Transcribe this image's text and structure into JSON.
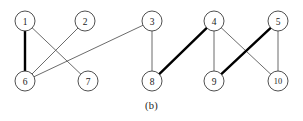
{
  "figure": {
    "caption": "(b)",
    "width": 303,
    "height": 121,
    "background_color": "#ffffff"
  },
  "chart_data": {
    "type": "diagram",
    "diagram_type": "graph-with-matching",
    "title": "",
    "caption": "(b)",
    "node_radius": 10,
    "node_count": 10,
    "edge_count": 10,
    "colors": {
      "thin_edge": "#5a5a5a",
      "thick_edge": "#000000",
      "node_stroke": "#3c3c3c",
      "node_fill": "#ffffff",
      "label": "#1a1a1a"
    },
    "nodes": [
      {
        "id": "1",
        "label": "1",
        "x": 25,
        "y": 21
      },
      {
        "id": "2",
        "label": "2",
        "x": 85,
        "y": 21
      },
      {
        "id": "3",
        "label": "3",
        "x": 152,
        "y": 21
      },
      {
        "id": "4",
        "label": "4",
        "x": 214,
        "y": 21
      },
      {
        "id": "5",
        "label": "5",
        "x": 278,
        "y": 21
      },
      {
        "id": "6",
        "label": "6",
        "x": 25,
        "y": 81
      },
      {
        "id": "7",
        "label": "7",
        "x": 88,
        "y": 81
      },
      {
        "id": "8",
        "label": "8",
        "x": 152,
        "y": 81
      },
      {
        "id": "9",
        "label": "9",
        "x": 214,
        "y": 81
      },
      {
        "id": "10",
        "label": "10",
        "x": 278,
        "y": 81
      }
    ],
    "edges": [
      {
        "source": "1",
        "target": "6",
        "weight": "thick"
      },
      {
        "source": "1",
        "target": "7",
        "weight": "thin"
      },
      {
        "source": "2",
        "target": "6",
        "weight": "thin"
      },
      {
        "source": "6",
        "target": "3",
        "weight": "thin"
      },
      {
        "source": "3",
        "target": "8",
        "weight": "thin"
      },
      {
        "source": "8",
        "target": "4",
        "weight": "thick"
      },
      {
        "source": "4",
        "target": "9",
        "weight": "thin"
      },
      {
        "source": "4",
        "target": "10",
        "weight": "thin"
      },
      {
        "source": "5",
        "target": "9",
        "weight": "thick"
      },
      {
        "source": "5",
        "target": "10",
        "weight": "thin"
      }
    ]
  }
}
